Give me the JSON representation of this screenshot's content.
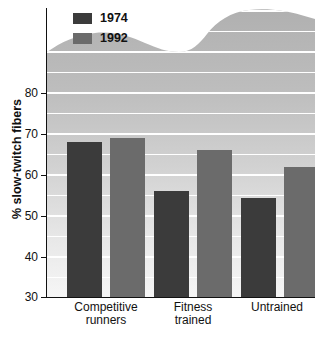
{
  "chart_data": {
    "type": "bar",
    "title": "",
    "subtitle": "",
    "xlabel": "",
    "ylabel": "% slow-twitch fibers",
    "ylim": [
      30,
      88
    ],
    "yticks": [
      30,
      40,
      50,
      60,
      70,
      80
    ],
    "ytick_labels": [
      "30",
      "40",
      "50",
      "60",
      "70",
      "80"
    ],
    "grid": true,
    "grid_interval": 5,
    "grid_color": "#ffffff",
    "legend_position": "top-left",
    "categories": [
      "Competitive runners",
      "Fitness trained",
      "Untrained"
    ],
    "category_lines": [
      [
        "Competitive",
        "runners"
      ],
      [
        "Fitness",
        "trained"
      ],
      [
        "Untrained",
        ""
      ]
    ],
    "series": [
      {
        "name": "1974",
        "color": "#3b3b3b",
        "values": [
          68,
          56,
          54.5
        ]
      },
      {
        "name": "1992",
        "color": "#6b6b6b",
        "values": [
          69,
          66,
          62
        ]
      }
    ],
    "background_gradient": {
      "top": "#b4b4b4",
      "bottom": "#f2f2f2"
    },
    "axis_color": "#111111"
  },
  "legend": {
    "items": [
      {
        "label": "1974",
        "color": "#3b3b3b"
      },
      {
        "label": "1992",
        "color": "#6b6b6b"
      }
    ]
  },
  "axis": {
    "y_title": "% slow-twitch fibers",
    "y_labels": [
      "80",
      "70",
      "60",
      "50",
      "40",
      "30"
    ]
  },
  "categories": [
    {
      "line1": "Competitive",
      "line2": "runners"
    },
    {
      "line1": "Fitness",
      "line2": "trained"
    },
    {
      "line1": "Untrained",
      "line2": ""
    }
  ]
}
